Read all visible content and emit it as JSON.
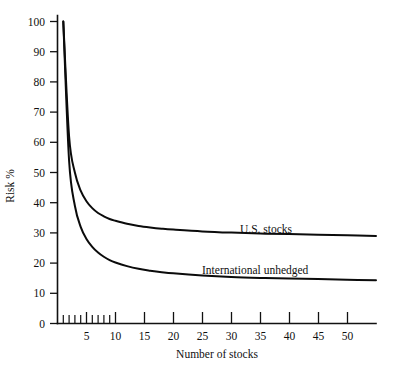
{
  "chart_data": {
    "type": "line",
    "title": "",
    "xlabel": "Number of stocks",
    "ylabel": "Risk %",
    "xlim": [
      0,
      55
    ],
    "ylim": [
      0,
      100
    ],
    "grid": false,
    "legend_position": "inline-right",
    "x_ticks": [
      5,
      10,
      15,
      20,
      25,
      30,
      35,
      40,
      45,
      50
    ],
    "x_tick_labels": [
      "5",
      "10",
      "15",
      "20",
      "25",
      "30",
      "35",
      "40",
      "45",
      "50"
    ],
    "x_minor_ticks": [
      1,
      2,
      3,
      4,
      6,
      7,
      8,
      9
    ],
    "y_ticks": [
      0,
      10,
      20,
      30,
      40,
      50,
      60,
      70,
      80,
      90,
      100
    ],
    "y_tick_labels": [
      "0",
      "10",
      "20",
      "30",
      "40",
      "50",
      "60",
      "70",
      "80",
      "90",
      "100"
    ],
    "x": [
      1,
      2,
      3,
      4,
      5,
      6,
      7,
      8,
      9,
      10,
      12,
      14,
      16,
      18,
      20,
      25,
      30,
      35,
      40,
      45,
      50,
      55
    ],
    "series": [
      {
        "name": "U.S. stocks",
        "color": "#0b0b0b",
        "asymptote": 29,
        "values": [
          100,
          62,
          50,
          44,
          40.5,
          38.2,
          36.6,
          35.5,
          34.6,
          34.0,
          33.0,
          32.3,
          31.8,
          31.4,
          31.1,
          30.5,
          30.1,
          29.8,
          29.6,
          29.4,
          29.2,
          29.0
        ]
      },
      {
        "name": "International unhedged",
        "color": "#0b0b0b",
        "asymptote": 14,
        "values": [
          100,
          54,
          39,
          32,
          28.0,
          25.4,
          23.5,
          22.1,
          21.0,
          20.2,
          19.0,
          18.1,
          17.5,
          17.0,
          16.6,
          15.9,
          15.4,
          15.1,
          14.9,
          14.7,
          14.5,
          14.3
        ]
      }
    ]
  },
  "labels": {
    "series_us": "U.S. stocks",
    "series_intl": "International unhedged",
    "x_axis_title": "Number of stocks",
    "y_axis_title": "Risk %"
  },
  "ticks": {
    "y": {
      "t0": "0",
      "t10": "10",
      "t20": "20",
      "t30": "30",
      "t40": "40",
      "t50": "50",
      "t60": "60",
      "t70": "70",
      "t80": "80",
      "t90": "90",
      "t100": "100"
    },
    "x": {
      "t5": "5",
      "t10": "10",
      "t15": "15",
      "t20": "20",
      "t25": "25",
      "t30": "30",
      "t35": "35",
      "t40": "40",
      "t45": "45",
      "t50": "50"
    }
  }
}
